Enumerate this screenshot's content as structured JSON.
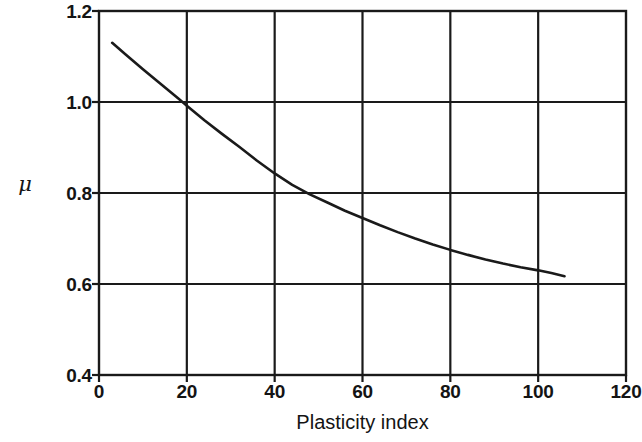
{
  "chart_data": {
    "type": "line",
    "title": "",
    "xlabel": "Plasticity index",
    "ylabel": "μ",
    "xlim": [
      0,
      120
    ],
    "ylim": [
      0.4,
      1.2
    ],
    "xticks": [
      0,
      20,
      40,
      60,
      80,
      100,
      120
    ],
    "xtick_labels": [
      "0",
      "20",
      "40",
      "60",
      "80",
      "100",
      "120"
    ],
    "yticks": [
      0.4,
      0.6,
      0.8,
      1.0,
      1.2
    ],
    "ytick_labels": [
      "0.4",
      "0.6",
      "0.8",
      "1.0",
      "1.2"
    ],
    "grid": true,
    "grid_color": "#1a1a1a",
    "legend": null,
    "line_color": "#1a1a1a",
    "line_width": 2.6,
    "series": [
      {
        "name": "mu vs plasticity index",
        "x": [
          3,
          6,
          10,
          14,
          18,
          20,
          24,
          28,
          32,
          36,
          40,
          44,
          48,
          52,
          56,
          60,
          64,
          68,
          72,
          76,
          80,
          84,
          88,
          92,
          96,
          100,
          103,
          106
        ],
        "y": [
          1.13,
          1.105,
          1.072,
          1.04,
          1.008,
          0.992,
          0.96,
          0.93,
          0.901,
          0.871,
          0.843,
          0.818,
          0.797,
          0.779,
          0.761,
          0.745,
          0.729,
          0.714,
          0.7,
          0.687,
          0.675,
          0.664,
          0.654,
          0.645,
          0.637,
          0.63,
          0.624,
          0.617
        ]
      }
    ],
    "annotations": []
  },
  "axes": {
    "y_title": "μ",
    "x_title": "Plasticity index"
  },
  "colors": {
    "background": "#ffffff",
    "ink": "#1a1a1a",
    "frame": "#1a1a1a"
  }
}
